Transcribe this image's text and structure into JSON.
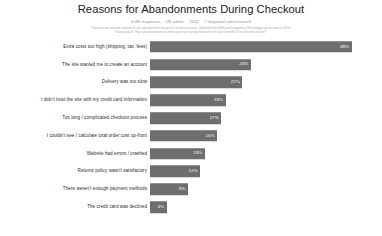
{
  "header": {
    "title": "Reasons for Abandonments During Checkout",
    "subtitle_parts": [
      "4.0M responses",
      "US adults",
      "2022",
      "© baymard.com/research"
    ],
    "note_line_1": "There are documented reasons for cart abandonment during the checkout process, collected from 4.0M panel responses. Percentages do not sum to 100%.",
    "note_line_2": "Survey asked: \"Have you abandoned an online purchase during checkout in the last 3 months? If so, for what reason?\""
  },
  "chart_data": {
    "type": "bar",
    "orientation": "horizontal",
    "title": "Reasons for Abandonments During Checkout",
    "subtitle": "4.0M responses · US adults · 2022 · © baymard.com/research",
    "xlabel": "",
    "ylabel": "",
    "xlim": [
      0,
      50
    ],
    "grid": false,
    "legend": false,
    "value_suffix": "%",
    "bar_color": "#6e6e6e",
    "label_color": "#ffffff",
    "background": "#ffffff",
    "categories": [
      "Extra costs too high (shipping, tax, fees)",
      "The site wanted me to create an account",
      "Delivery was too slow",
      "I didn't trust the site with my credit card information",
      "Too long / complicated checkout process",
      "I couldn't see / calculate total order cost up-front",
      "Website had errors / crashed",
      "Returns policy wasn't satisfactory",
      "There weren't enough payment methods",
      "The credit card was declined"
    ],
    "values": [
      48,
      24,
      22,
      18,
      17,
      16,
      13,
      12,
      9,
      4
    ],
    "value_labels": [
      "48%",
      "24%",
      "22%",
      "18%",
      "17%",
      "16%",
      "13%",
      "12%",
      "9%",
      "4%"
    ]
  }
}
